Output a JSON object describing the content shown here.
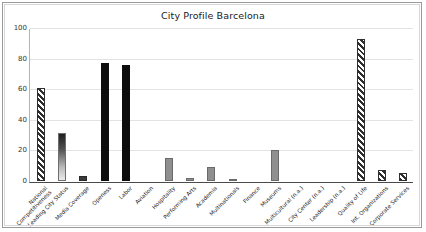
{
  "chart_data": {
    "type": "bar",
    "title": "City Profile Barcelona",
    "xlabel": "",
    "ylabel": "",
    "ylim": [
      0,
      100
    ],
    "yticks": [
      0,
      20,
      40,
      60,
      80,
      100
    ],
    "grid": true,
    "legend": "none",
    "categories": [
      "National Competitiveness",
      "Leading City Status",
      "Media Coverage",
      "Openess",
      "Labor",
      "Aviation",
      "Hospitality",
      "Performing Arts",
      "Academia",
      "Multinationals",
      "Finance",
      "Museums",
      "Multicultural (n.a.)",
      "City Center (n.a.)",
      "Leadership (n.a.)",
      "Quality of Life",
      "Int. Organizations",
      "Corporate Services"
    ],
    "category_lines": [
      [
        "National",
        "Competitiveness"
      ],
      [
        "Leading City Status"
      ],
      [
        "Media Coverage"
      ],
      [
        "Openess"
      ],
      [
        "Labor"
      ],
      [
        "Aviation"
      ],
      [
        "Hospitality"
      ],
      [
        "Performing Arts"
      ],
      [
        "Academia"
      ],
      [
        "Multinationals"
      ],
      [
        "Finance"
      ],
      [
        "Museums"
      ],
      [
        "Multicultural (n.a.)"
      ],
      [
        "City Center (n.a.)"
      ],
      [
        "Leadership (n.a.)"
      ],
      [
        "Quality of Life"
      ],
      [
        "Int. Organizations"
      ],
      [
        "Corporate Services"
      ]
    ],
    "values": [
      61,
      31.5,
      3.5,
      77,
      76,
      0,
      15,
      2,
      9,
      1.2,
      0,
      20,
      0,
      0,
      0,
      92.5,
      7,
      5
    ],
    "bar_styles": [
      "hatch",
      "gradient",
      "darkgray",
      "black",
      "black",
      "none",
      "gray",
      "gray",
      "gray",
      "gray",
      "none",
      "gray",
      "none",
      "none",
      "none",
      "hatch",
      "hatch",
      "hatch"
    ]
  },
  "colors": {
    "frame_border": "#9a9a9a",
    "plot_background": "#ffffff",
    "gridline": "#e3e3e3",
    "axis": "#4a4a4a",
    "bar_black": "#0d0d0d",
    "bar_gray": "#8f8f8f",
    "bar_darkgray": "#3b3b3b",
    "hatch_stroke": "#2e2e2e",
    "title_text": "#1a1a1a",
    "tick_text": "#333333"
  }
}
